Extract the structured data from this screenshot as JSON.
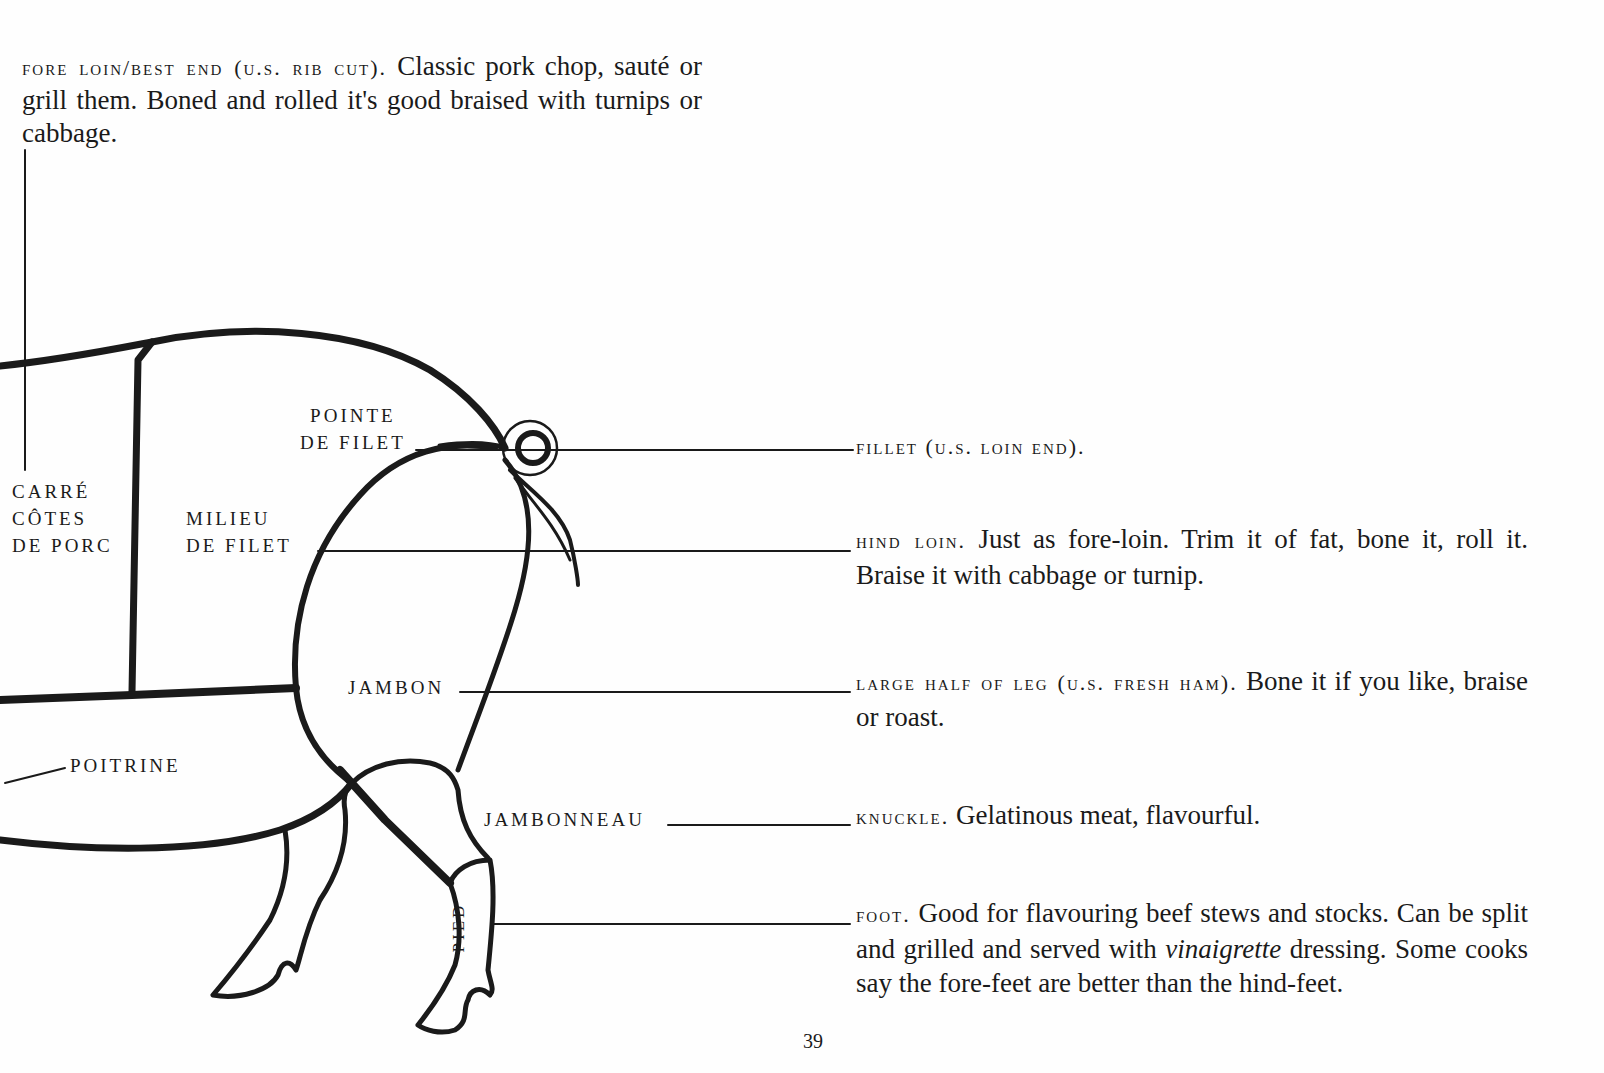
{
  "page": {
    "number": "39"
  },
  "top_note": {
    "heading": "FORE LOIN/BEST END (U.S. RIB CUT).",
    "text": "Classic pork chop, sauté or grill them. Boned and rolled it's good braised with turnips or cabbage."
  },
  "diagram_labels": {
    "carre": [
      "CARRÉ",
      "CÔTES",
      "DE PORC"
    ],
    "milieu": [
      "MILIEU",
      "DE FILET"
    ],
    "pointe": [
      "POINTE",
      "DE FILET"
    ],
    "jambon": "JAMBON",
    "poitrine": "POITRINE",
    "jambonneau": "JAMBONNEAU",
    "pied": "PIED"
  },
  "descriptions": [
    {
      "id": "fillet",
      "heading": "FILLET (U.S. LOIN END).",
      "text": ""
    },
    {
      "id": "hind-loin",
      "heading": "HIND LOIN.",
      "text": "Just as fore-loin. Trim it of fat, bone it, roll it. Braise it with cabbage or turnip."
    },
    {
      "id": "large-half-of-leg",
      "heading": "LARGE HALF OF LEG (U.S. FRESH HAM).",
      "text": "Bone it if you like, braise or roast."
    },
    {
      "id": "knuckle",
      "heading": "KNUCKLE.",
      "text": "Gelatinous meat, flavourful."
    },
    {
      "id": "foot",
      "heading": "FOOT.",
      "text_before": "Good for flavouring beef stews and stocks. Can be split and grilled and served with",
      "italic": "vinaigrette",
      "text_after": "dressing. Some cooks say the fore-feet are better than the hind-feet."
    }
  ],
  "colors": {
    "ink": "#1a1a1a",
    "paper": "#fefefe"
  }
}
